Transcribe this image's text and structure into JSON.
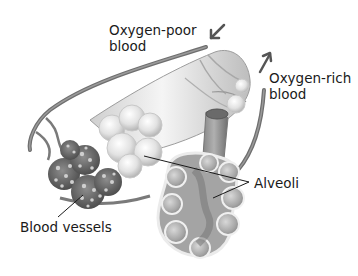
{
  "diagram": {
    "style": "grayscale illustration",
    "labels": {
      "oxygen_poor": {
        "line1": "Oxygen-poor",
        "line2": "blood"
      },
      "oxygen_rich": {
        "line1": "Oxygen-rich",
        "line2": "blood"
      },
      "alveoli": "Alveoli",
      "blood_vessels": "Blood vessels"
    },
    "arrows": [
      {
        "name": "oxygen-poor-inflow-arrow",
        "direction": "down-left"
      },
      {
        "name": "oxygen-rich-outflow-arrow",
        "direction": "up-right"
      }
    ],
    "colors": {
      "background": "#ffffff",
      "text": "#1a1a1a",
      "vessel": "#7a7a7a",
      "arrow": "#555555",
      "alveoli_light": "#e6e6e6",
      "alveoli_dark": "#8c8c8c"
    }
  }
}
